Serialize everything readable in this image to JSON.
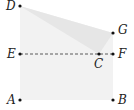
{
  "diagram": {
    "type": "geometry-folding",
    "colors": {
      "background": "#ffffff",
      "region_fill": "#f2f2f2",
      "fold_fill": "#e6e6e6",
      "point": "#111111",
      "dashed_line": "#333333"
    },
    "points": {
      "A": {
        "label": "A",
        "x": 20,
        "y": 100
      },
      "B": {
        "label": "B",
        "x": 113,
        "y": 100
      },
      "C": {
        "label": "C",
        "x": 99,
        "y": 54
      },
      "D": {
        "label": "D",
        "x": 20,
        "y": 6
      },
      "E": {
        "label": "E",
        "x": 20,
        "y": 54
      },
      "F": {
        "label": "F",
        "x": 113,
        "y": 54
      },
      "G": {
        "label": "G",
        "x": 113,
        "y": 33
      }
    },
    "segments": [
      {
        "from": "E",
        "to": "F",
        "style": "dashed"
      }
    ],
    "regions": [
      {
        "vertices": [
          "D",
          "G",
          "B",
          "A"
        ],
        "fill": "region"
      },
      {
        "vertices": [
          "D",
          "G",
          "C"
        ],
        "fill": "fold"
      }
    ]
  }
}
